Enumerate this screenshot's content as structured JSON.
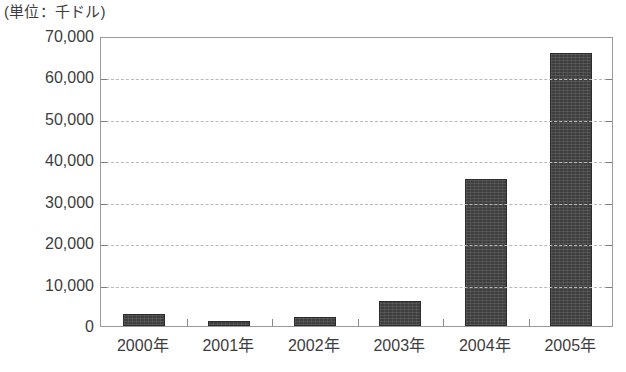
{
  "caption": {
    "unit_note": "(単位：千ドル)"
  },
  "axis": {
    "y_ticks": [
      "70,000",
      "60,000",
      "50,000",
      "40,000",
      "30,000",
      "20,000",
      "10,000",
      "0"
    ],
    "x_ticks": [
      "2000年",
      "2001年",
      "2002年",
      "2003年",
      "2004年",
      "2005年"
    ]
  },
  "colors": {
    "bar_fill": "#3f3f3f",
    "bar_stroke": "#2b2b2b",
    "gridline": "#b9b9b9",
    "plot_border": "#9a9a9a",
    "text": "#3d3d3d"
  },
  "chart_data": {
    "type": "bar",
    "title": "",
    "subtitle": "",
    "unit_label": "(単位：千ドル)",
    "xlabel": "",
    "ylabel": "",
    "categories": [
      "2000年",
      "2001年",
      "2002年",
      "2003年",
      "2004年",
      "2005年"
    ],
    "values": [
      2900,
      1200,
      2200,
      6000,
      35500,
      66000
    ],
    "ylim": [
      0,
      70000
    ],
    "ytick_step": 10000,
    "ytick_values": [
      0,
      10000,
      20000,
      30000,
      40000,
      50000,
      60000,
      70000
    ],
    "grid": true,
    "grid_style": "dashed-horizontal",
    "legend": false,
    "legend_position": "none",
    "series": [
      {
        "name": "金額",
        "values": [
          2900,
          1200,
          2200,
          6000,
          35500,
          66000
        ]
      }
    ]
  }
}
